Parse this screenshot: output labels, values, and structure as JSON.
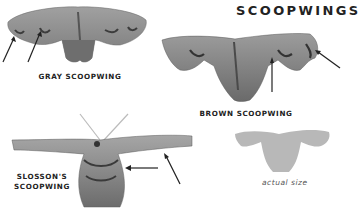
{
  "title": "SCOOPWINGS",
  "moths": [
    {
      "name": "GRAY SCOOPWING",
      "label_lines": [
        "GRAY SCOOPWING"
      ]
    },
    {
      "name": "BROWN SCOOPWING",
      "label_lines": [
        "BROWN SCOOPWING"
      ]
    },
    {
      "name": "SLOSSON'S SCOOPWING",
      "label_lines": [
        "SLOSSON'S",
        "SCOOPWING"
      ]
    }
  ],
  "silhouette_caption": "actual size",
  "colors": {
    "moth_gray": "#8c8c8c",
    "moth_dark": "#4a4a4a",
    "silhouette": "#b8b8b8",
    "arrow": "#222222"
  }
}
